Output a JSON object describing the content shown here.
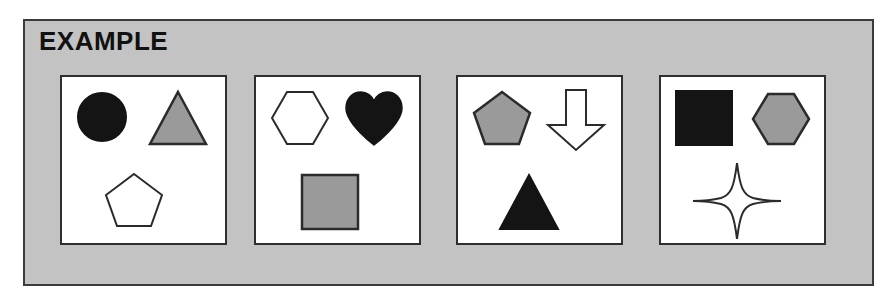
{
  "header": {
    "title": "EXAMPLE"
  },
  "colors": {
    "background": "#c3c3c3",
    "frame_border": "#3b3b3b",
    "panel_background": "#ffffff",
    "panel_border": "#2f2f2f",
    "fill_black": "#141414",
    "fill_gray": "#9a9a9a",
    "fill_white": "#ffffff",
    "outline": "#2b2b2b"
  },
  "panels": [
    {
      "id": "panel-1",
      "label": "Panel 1",
      "shapes": [
        {
          "name": "circle-shape",
          "shape": "circle",
          "fill": "black",
          "position": "top-left"
        },
        {
          "name": "triangle-shape",
          "shape": "triangle",
          "fill": "gray",
          "position": "top-right"
        },
        {
          "name": "pentagon-shape",
          "shape": "pentagon",
          "fill": "white",
          "position": "bottom-center"
        }
      ]
    },
    {
      "id": "panel-2",
      "label": "Panel 2",
      "shapes": [
        {
          "name": "hexagon-shape",
          "shape": "hexagon",
          "fill": "white",
          "position": "top-left"
        },
        {
          "name": "heart-shape",
          "shape": "heart",
          "fill": "black",
          "position": "top-right"
        },
        {
          "name": "square-shape",
          "shape": "square",
          "fill": "gray",
          "position": "bottom-center"
        }
      ]
    },
    {
      "id": "panel-3",
      "label": "Panel 3",
      "shapes": [
        {
          "name": "pentagon-shape",
          "shape": "pentagon",
          "fill": "gray",
          "position": "top-left"
        },
        {
          "name": "down-arrow-shape",
          "shape": "down-arrow",
          "fill": "white",
          "position": "top-right"
        },
        {
          "name": "triangle-shape",
          "shape": "triangle",
          "fill": "black",
          "position": "bottom-center"
        }
      ]
    },
    {
      "id": "panel-4",
      "label": "Panel 4",
      "shapes": [
        {
          "name": "square-shape",
          "shape": "square",
          "fill": "black",
          "position": "top-left"
        },
        {
          "name": "hexagon-shape",
          "shape": "hexagon",
          "fill": "gray",
          "position": "top-right"
        },
        {
          "name": "four-point-star-shape",
          "shape": "four-point-star",
          "fill": "white",
          "position": "bottom-center"
        }
      ]
    }
  ]
}
